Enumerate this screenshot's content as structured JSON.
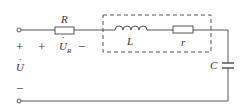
{
  "diagram": {
    "type": "circuit",
    "components": {
      "resistor_R": {
        "label": "R"
      },
      "inductor_L": {
        "label": "L"
      },
      "resistor_r": {
        "label": "r"
      },
      "capacitor_C": {
        "label": "C"
      }
    },
    "voltages": {
      "source": {
        "plus": "+",
        "symbol": "U",
        "dot": "·",
        "minus": "−"
      },
      "across_R": {
        "plus": "+",
        "symbol": "U",
        "subscript": "R",
        "dot": "·",
        "minus": "−"
      }
    },
    "colors": {
      "wire": "#555555",
      "text": "#333333",
      "background": "#ffffff"
    }
  }
}
